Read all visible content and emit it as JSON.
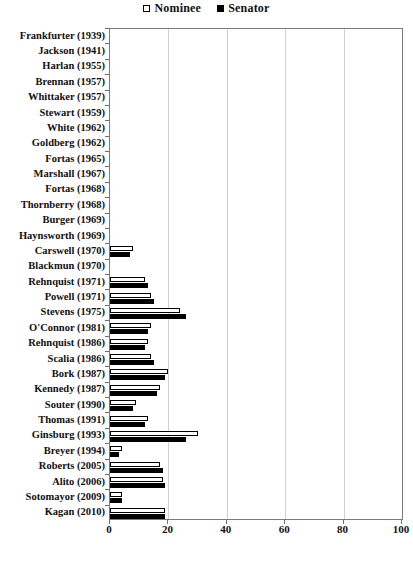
{
  "legend": {
    "entries": [
      {
        "label": "Nominee",
        "marker": "hollow-square",
        "color": "#ffffff"
      },
      {
        "label": "Senator",
        "marker": "filled-square",
        "color": "#000000"
      }
    ]
  },
  "axis": {
    "x_ticks": [
      "0",
      "20",
      "40",
      "60",
      "80",
      "100"
    ]
  },
  "chart_data": {
    "type": "bar",
    "orientation": "horizontal",
    "title": "",
    "xlabel": "",
    "ylabel": "",
    "xlim": [
      0,
      100
    ],
    "grid": true,
    "legend_position": "top-center",
    "categories": [
      "Frankfurter (1939)",
      "Jackson (1941)",
      "Harlan (1955)",
      "Brennan (1957)",
      "Whittaker (1957)",
      "Stewart (1959)",
      "White (1962)",
      "Goldberg (1962)",
      "Fortas (1965)",
      "Marshall (1967)",
      "Fortas (1968)",
      "Thornberry (1968)",
      "Burger (1969)",
      "Haynsworth (1969)",
      "Carswell (1970)",
      "Blackmun (1970)",
      "Rehnquist (1971)",
      "Powell (1971)",
      "Stevens (1975)",
      "O'Connor (1981)",
      "Rehnquist (1986)",
      "Scalia (1986)",
      "Bork (1987)",
      "Kennedy (1987)",
      "Souter (1990)",
      "Thomas (1991)",
      "Ginsburg (1993)",
      "Breyer (1994)",
      "Roberts (2005)",
      "Alito (2006)",
      "Sotomayor (2009)",
      "Kagan (2010)"
    ],
    "series": [
      {
        "name": "Nominee",
        "values": [
          0,
          0,
          0,
          0,
          0,
          0,
          0,
          0,
          0,
          0,
          0,
          0,
          0,
          0,
          8,
          0,
          12,
          14,
          24,
          14,
          13,
          14,
          20,
          17,
          9,
          13,
          30,
          4,
          17,
          18,
          4,
          19
        ]
      },
      {
        "name": "Senator",
        "values": [
          0,
          0,
          0,
          0,
          0,
          0,
          0,
          0,
          0,
          0,
          0,
          0,
          0,
          0,
          7,
          0,
          13,
          15,
          26,
          13,
          12,
          15,
          19,
          16,
          8,
          12,
          26,
          3,
          18,
          19,
          4,
          19
        ]
      }
    ]
  }
}
